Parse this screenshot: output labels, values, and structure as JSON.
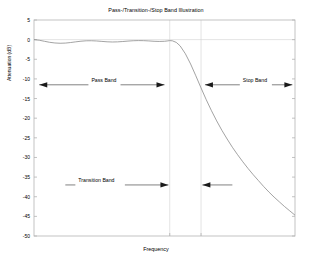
{
  "chart_data": {
    "type": "line",
    "title": "Pass-/Transition-/Stop Band Illustration",
    "xlabel": "Frequency",
    "ylabel": "Attenuation (dB)",
    "xlim": [
      0,
      1
    ],
    "ylim": [
      -50,
      5
    ],
    "yticks": [
      5,
      0,
      -5,
      -10,
      -15,
      -20,
      -25,
      -30,
      -35,
      -40,
      -45,
      -50
    ],
    "ytick_labels": [
      "5",
      "0",
      "-5",
      "-10",
      "-15",
      "-20",
      "-25",
      "-30",
      "-35",
      "-40",
      "-45",
      "-50"
    ],
    "xticks": [],
    "xtick_labels": [],
    "grid": false,
    "vertical_gridlines": [
      0.52,
      0.64
    ],
    "series": [
      {
        "name": "Filter magnitude response",
        "color": "#8c8c8c",
        "x": [
          0.0,
          0.02,
          0.04,
          0.06,
          0.08,
          0.1,
          0.12,
          0.14,
          0.16,
          0.18,
          0.2,
          0.22,
          0.24,
          0.26,
          0.28,
          0.3,
          0.32,
          0.34,
          0.36,
          0.38,
          0.4,
          0.42,
          0.44,
          0.46,
          0.48,
          0.5,
          0.51,
          0.52,
          0.53,
          0.545,
          0.56,
          0.58,
          0.6,
          0.62,
          0.64,
          0.66,
          0.68,
          0.7,
          0.72,
          0.74,
          0.76,
          0.78,
          0.8,
          0.82,
          0.84,
          0.86,
          0.88,
          0.9,
          0.92,
          0.94,
          0.96,
          0.98,
          1.0
        ],
        "y": [
          0.0,
          -0.15,
          -0.42,
          -0.68,
          -0.85,
          -0.92,
          -0.88,
          -0.74,
          -0.56,
          -0.4,
          -0.3,
          -0.28,
          -0.34,
          -0.45,
          -0.55,
          -0.6,
          -0.57,
          -0.48,
          -0.37,
          -0.28,
          -0.24,
          -0.26,
          -0.33,
          -0.42,
          -0.46,
          -0.42,
          -0.34,
          -0.25,
          -0.3,
          -0.7,
          -1.6,
          -3.6,
          -6.2,
          -9.2,
          -12.3,
          -15.3,
          -18.1,
          -20.7,
          -23.1,
          -25.3,
          -27.4,
          -29.3,
          -31.1,
          -32.8,
          -34.4,
          -35.9,
          -37.4,
          -38.8,
          -40.1,
          -41.3,
          -42.5,
          -43.6,
          -44.7
        ]
      }
    ],
    "annotations": [
      {
        "id": "pass-band",
        "label": "Pass Band",
        "y_value": -11.5,
        "x_start": 0.02,
        "x_end": 0.5,
        "arrow": "double",
        "label_x": 0.22
      },
      {
        "id": "stop-band",
        "label": "Stop Band",
        "y_value": -11.5,
        "x_start": 0.655,
        "x_end": 0.99,
        "arrow": "double",
        "label_x": 0.8
      },
      {
        "id": "transition-band-left",
        "label": "Transition Band",
        "y_value": -37.0,
        "x_start": 0.12,
        "x_end": 0.515,
        "arrow": "right",
        "label_x": 0.17
      },
      {
        "id": "transition-band-right",
        "label": "",
        "y_value": -37.0,
        "x_start": 0.76,
        "x_end": 0.645,
        "arrow": "left",
        "label_x": 0.0
      }
    ]
  },
  "figure": {
    "axes_color": "#b4b4b4",
    "grid_color": "#d2d2d2",
    "curve_color": "#8c8c8c",
    "annotation_color": "#1a1a1a",
    "background": "#ffffff"
  }
}
